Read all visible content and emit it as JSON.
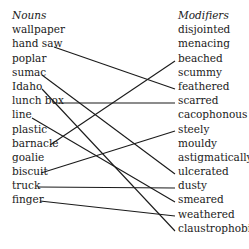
{
  "nouns": {
    "header": "Nouns",
    "items": [
      "wallpaper",
      "hand saw",
      "poplar",
      "sumac",
      "Idaho",
      "lunch box",
      "line",
      "plastic",
      "barnacle",
      "goalie",
      "biscuit",
      "truck",
      "finger"
    ]
  },
  "modifiers": {
    "header": "Modifiers",
    "items": [
      "disjointed",
      "menacing",
      "beached",
      "scummy",
      "feathered",
      "scarred",
      "cacophonous",
      "steely",
      "mouldy",
      "astigmatically",
      "ulcerated",
      "dusty",
      "smeared",
      "weathered",
      "claustrophobic"
    ]
  },
  "connections": [
    {
      "noun": "hand saw",
      "modifier": "feathered"
    },
    {
      "noun": "sumac",
      "modifier": "ulcerated"
    },
    {
      "noun": "Idaho",
      "modifier": "claustrophobic"
    },
    {
      "noun": "lunch box",
      "modifier": "scarred"
    },
    {
      "noun": "line",
      "modifier": "smeared"
    },
    {
      "noun": "barnacle",
      "modifier": "beached"
    },
    {
      "noun": "biscuit",
      "modifier": "steely"
    },
    {
      "noun": "truck",
      "modifier": "dusty"
    },
    {
      "noun": "finger",
      "modifier": "weathered"
    }
  ]
}
